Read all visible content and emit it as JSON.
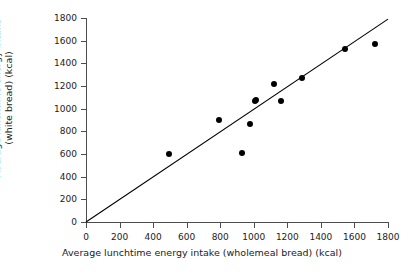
{
  "chart_data": {
    "type": "scatter",
    "title": "",
    "xlabel": "Average lunchtime energy intake (wholemeal bread) (kcal)",
    "ylabel_line1": "Average lunchtime energy intake",
    "ylabel_line2": "(white bread) (kcal)",
    "xlim": [
      0,
      1800
    ],
    "ylim": [
      0,
      1800
    ],
    "xticks": [
      0,
      200,
      400,
      600,
      800,
      1000,
      1200,
      1400,
      1600,
      1800
    ],
    "yticks": [
      0,
      200,
      400,
      600,
      800,
      1000,
      1200,
      1400,
      1600,
      1800
    ],
    "xticklabels": [
      "0",
      "200",
      "400",
      "600",
      "800",
      "1000",
      "1200",
      "1400",
      "1600",
      "1800"
    ],
    "yticklabels": [
      "0",
      "200",
      "400",
      "600",
      "800",
      "1000",
      "1200",
      "1400",
      "1600",
      "1800"
    ],
    "grid": false,
    "legend": null,
    "marker_color": "#000000",
    "line_color": "#000000",
    "axis_color": "#4d4d4d",
    "background_color": "#ffffff",
    "points": [
      {
        "x": 495,
        "y": 600
      },
      {
        "x": 790,
        "y": 900
      },
      {
        "x": 930,
        "y": 610
      },
      {
        "x": 975,
        "y": 865
      },
      {
        "x": 1005,
        "y": 1065
      },
      {
        "x": 1015,
        "y": 1080
      },
      {
        "x": 1120,
        "y": 1215
      },
      {
        "x": 1165,
        "y": 1065
      },
      {
        "x": 1285,
        "y": 1270
      },
      {
        "x": 1545,
        "y": 1525
      },
      {
        "x": 1725,
        "y": 1575
      }
    ],
    "reference_line": {
      "name": "line-of-equality",
      "x0": 0,
      "y0": 0,
      "x1": 1800,
      "y1": 1790
    }
  }
}
